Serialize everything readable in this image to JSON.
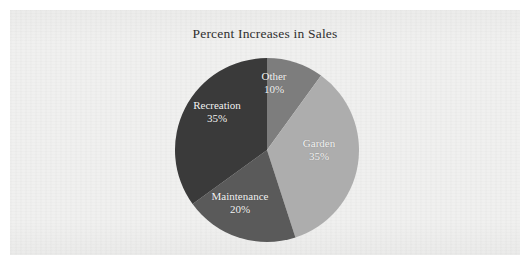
{
  "chart_data": {
    "type": "pie",
    "title": "Percent Increases in Sales",
    "xlabel": "",
    "ylabel": "",
    "legend": "none",
    "labels_inside_slices": true,
    "start_angle_deg": 0,
    "direction": "clockwise",
    "categories": [
      "Other",
      "Garden",
      "Maintenance",
      "Recreation"
    ],
    "values": [
      10,
      35,
      20,
      35
    ],
    "value_unit": "%",
    "slices": [
      {
        "name": "Other",
        "value": 10,
        "label": "Other",
        "value_label": "10%",
        "color": "#7d7d7d",
        "start_angle_deg": 0,
        "sweep_deg": 36
      },
      {
        "name": "Garden",
        "value": 35,
        "label": "Garden",
        "value_label": "35%",
        "color": "#adadad",
        "start_angle_deg": 36,
        "sweep_deg": 126
      },
      {
        "name": "Maintenance",
        "value": 20,
        "label": "Maintenance",
        "value_label": "20%",
        "color": "#5a5a5a",
        "start_angle_deg": 162,
        "sweep_deg": 72
      },
      {
        "name": "Recreation",
        "value": 35,
        "label": "Recreation",
        "value_label": "35%",
        "color": "#3a3a3a",
        "start_angle_deg": 234,
        "sweep_deg": 126
      }
    ]
  },
  "page": {
    "background_color": "#ffffff",
    "paper_color": "#f0f0ef",
    "label_text_color": "#f4f4f4",
    "title_text_color": "#2f2f2f"
  }
}
